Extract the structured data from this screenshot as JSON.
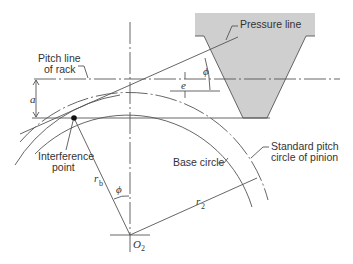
{
  "diagram": {
    "type": "gear-rack interference geometry",
    "labels": {
      "pressure_line": "Pressure line",
      "pitch_line_1": "Pitch line",
      "pitch_line_2": "of rack",
      "a": "a",
      "e": "e",
      "phi_top": "ϕ",
      "phi_bottom": "ϕ",
      "interference_1": "Interference",
      "interference_2": "point",
      "base_circle": "Base circle",
      "std_pitch_1": "Standard pitch",
      "std_pitch_2": "circle of pinion",
      "rb": "r",
      "rb_sub": "b",
      "r2": "r",
      "r2_sub": "2",
      "o2": "O",
      "o2_sub": "2"
    },
    "colors": {
      "rack_fill": "#cfcfcf",
      "line": "#555555",
      "outline": "#333333"
    }
  }
}
